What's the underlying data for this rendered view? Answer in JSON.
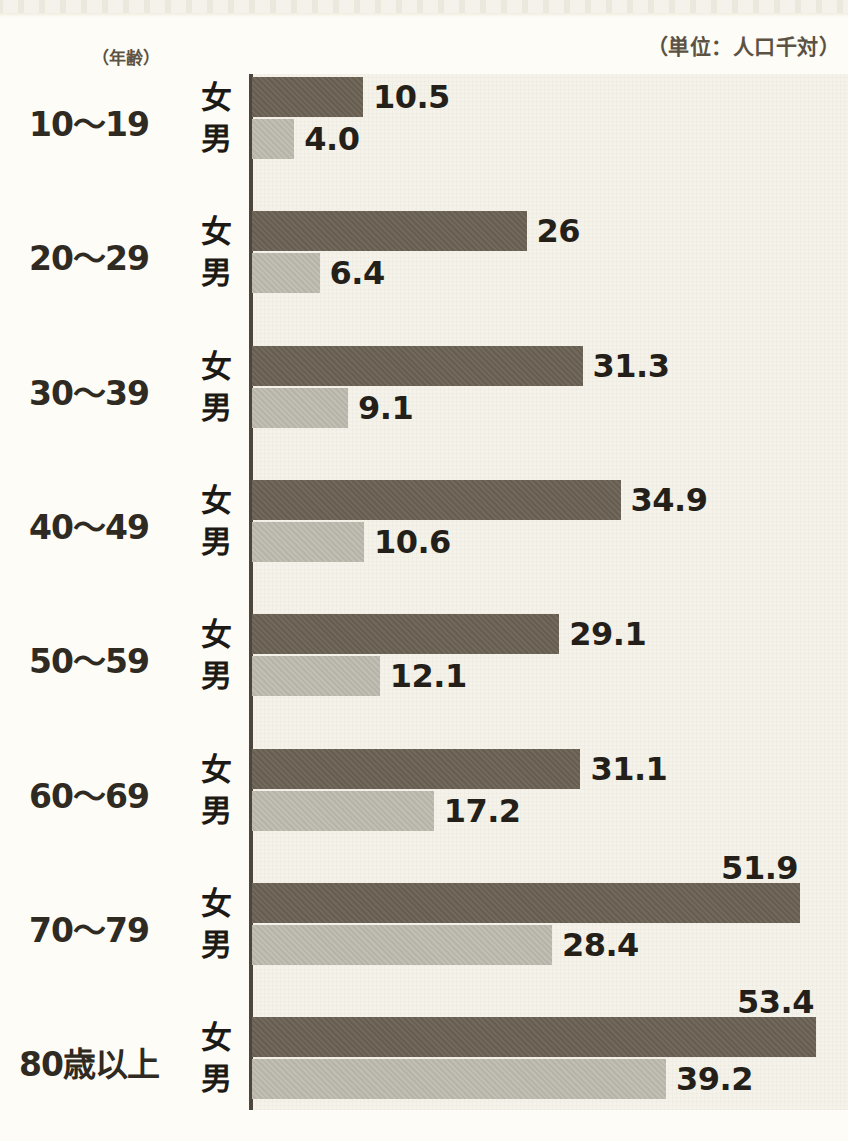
{
  "header": {
    "age_axis_label": "（年齢）",
    "unit_label": "（単位：人口千対）"
  },
  "series_letters": {
    "female": "女",
    "male": "男"
  },
  "chart_data": {
    "type": "bar",
    "orientation": "horizontal",
    "title": "",
    "subtitle": "",
    "xlabel": "",
    "ylabel": "（年齢）",
    "unit": "（単位：人口千対）",
    "grid": false,
    "legend_position": "inline-row-labels",
    "xlim": [
      0,
      56
    ],
    "categories": [
      "10～19",
      "20～29",
      "30～39",
      "40～49",
      "50～59",
      "60～69",
      "70～79",
      "80歳以上"
    ],
    "series": [
      {
        "name": "女",
        "color": "#6a6154",
        "values": [
          10.5,
          26,
          31.3,
          34.9,
          29.1,
          31.1,
          51.9,
          53.4
        ],
        "labels": [
          "10.5",
          "26",
          "31.3",
          "34.9",
          "29.1",
          "31.1",
          "51.9",
          "53.4"
        ]
      },
      {
        "name": "男",
        "color": "#bcb9ae",
        "values": [
          4.0,
          6.4,
          9.1,
          10.6,
          12.1,
          17.2,
          28.4,
          39.2
        ],
        "labels": [
          "4.0",
          "6.4",
          "9.1",
          "10.6",
          "12.1",
          "17.2",
          "28.4",
          "39.2"
        ]
      }
    ]
  },
  "colors": {
    "female_bar": "#6a6154",
    "male_bar": "#bcb9ae",
    "plot_background": "#f4f2e9",
    "page_background": "#fdfcf7",
    "axis": "#4e463c",
    "text": "#2f2a22",
    "header_text": "#5b5243"
  }
}
